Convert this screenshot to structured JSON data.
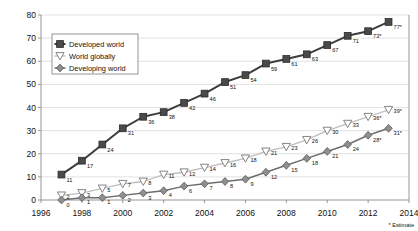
{
  "chart_data": {
    "type": "line",
    "title": "",
    "subtitle": "",
    "xlabel": "",
    "ylabel": "",
    "x": [
      1997,
      1998,
      1999,
      2000,
      2001,
      2002,
      2003,
      2004,
      2005,
      2006,
      2007,
      2008,
      2009,
      2010,
      2011,
      2012,
      2013
    ],
    "xlim": [
      1996,
      2014
    ],
    "ylim": [
      0,
      80
    ],
    "xticks": [
      "1996",
      "1998",
      "2000",
      "2002",
      "2004",
      "2006",
      "2008",
      "2010",
      "2012",
      "2014"
    ],
    "xtick_values": [
      1996,
      1998,
      2000,
      2002,
      2004,
      2006,
      2008,
      2010,
      2012,
      2014
    ],
    "yticks": [
      "0",
      "10",
      "20",
      "30",
      "40",
      "50",
      "60",
      "70",
      "80"
    ],
    "ytick_values": [
      0,
      10,
      20,
      30,
      40,
      50,
      60,
      70,
      80
    ],
    "grid": true,
    "legend_position": "upper-left-inside",
    "annotation": "* Estimate",
    "series": [
      {
        "name": "Developed world",
        "marker": "square",
        "color": "#4a4a4a",
        "line_color": "#3d3d3d",
        "values": [
          11,
          17,
          24,
          31,
          36,
          38,
          42,
          46,
          51,
          54,
          59,
          61,
          63,
          67,
          71,
          73,
          77
        ],
        "labels": [
          "11",
          "17",
          "24",
          "31",
          "36",
          "38",
          "42",
          "46",
          "51",
          "54",
          "59",
          "61",
          "63",
          "67",
          "71",
          "73*",
          "77*"
        ]
      },
      {
        "name": "World globally",
        "marker": "triangle-down",
        "color": "#ffffff",
        "line_color": "#bdbdbd",
        "values": [
          2,
          3,
          5,
          7,
          8,
          11,
          12,
          14,
          16,
          18,
          21,
          23,
          26,
          30,
          33,
          36,
          39
        ],
        "labels": [
          "2",
          "3",
          "5",
          "7",
          "8",
          "11",
          "12",
          "14",
          "16",
          "18",
          "21",
          "23",
          "26",
          "30",
          "33",
          "36*",
          "39*"
        ]
      },
      {
        "name": "Developing world",
        "marker": "diamond",
        "color": "#8f8f8f",
        "line_color": "#6e6e6e",
        "values": [
          0,
          1,
          1,
          2,
          3,
          4,
          6,
          7,
          8,
          9,
          12,
          15,
          18,
          21,
          24,
          28,
          31
        ],
        "labels": [
          "0",
          "1",
          "1",
          "2",
          "3",
          "4",
          "6",
          "7",
          "8",
          "9",
          "12",
          "15",
          "18",
          "21",
          "24",
          "28*",
          "31*"
        ]
      }
    ]
  },
  "legend": {
    "items": [
      {
        "label": "Developed world"
      },
      {
        "label": "World globally"
      },
      {
        "label": "Developing world"
      }
    ]
  },
  "footnote": {
    "text": "* Estimate"
  }
}
